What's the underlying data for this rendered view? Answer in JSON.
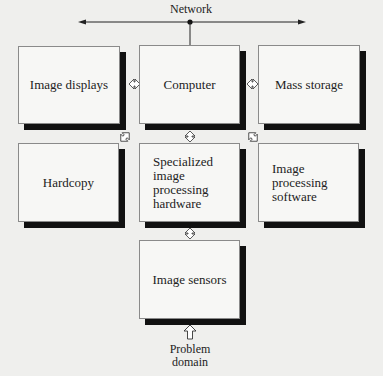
{
  "network": {
    "label": "Network"
  },
  "boxes": {
    "image_displays": {
      "label": "Image displays"
    },
    "computer": {
      "label": "Computer"
    },
    "mass_storage": {
      "label": "Mass storage"
    },
    "hardcopy": {
      "label": "Hardcopy"
    },
    "specialized_hardware": {
      "label": "Specialized\nimage processing\nhardware"
    },
    "processing_software": {
      "label": "Image processing\nsoftware"
    },
    "image_sensors": {
      "label": "Image sensors"
    }
  },
  "problem_domain": {
    "label": "Problem\ndomain"
  },
  "connections": [
    {
      "from": "network",
      "to": "computer",
      "type": "line"
    },
    {
      "from": "image_displays",
      "to": "computer",
      "type": "double-arrow"
    },
    {
      "from": "computer",
      "to": "mass_storage",
      "type": "double-arrow"
    },
    {
      "from": "hardcopy",
      "to": "computer",
      "type": "double-arrow-diagonal"
    },
    {
      "from": "computer",
      "to": "specialized_hardware",
      "type": "double-arrow"
    },
    {
      "from": "processing_software",
      "to": "computer",
      "type": "double-arrow-diagonal"
    },
    {
      "from": "specialized_hardware",
      "to": "image_sensors",
      "type": "double-arrow"
    },
    {
      "from": "problem_domain",
      "to": "image_sensors",
      "type": "arrow"
    }
  ]
}
